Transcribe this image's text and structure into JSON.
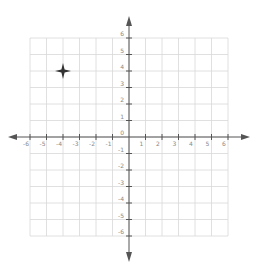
{
  "chart_data": {
    "type": "scatter",
    "title": "",
    "xlabel": "",
    "ylabel": "",
    "xlim": [
      -6,
      6
    ],
    "ylim": [
      -6,
      6
    ],
    "grid": true,
    "x_ticks": [
      -6,
      -5,
      -4,
      -3,
      -2,
      -1,
      1,
      2,
      3,
      4,
      5,
      6
    ],
    "y_ticks": [
      -6,
      -5,
      -4,
      -3,
      -2,
      -1,
      0,
      1,
      2,
      3,
      4,
      5,
      6
    ],
    "points": [
      {
        "x": -4,
        "y": 4,
        "marker": "four-point-star"
      }
    ]
  },
  "colors": {
    "axis": "#555555",
    "grid": "#d8d8d8",
    "label": "#888888",
    "marker": "#333333"
  }
}
